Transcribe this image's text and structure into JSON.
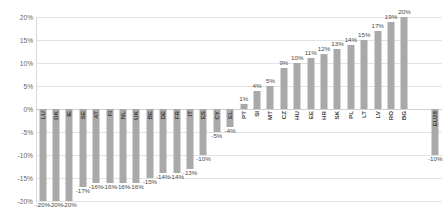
{
  "chart_data": {
    "type": "bar",
    "title": "",
    "subtitle": "",
    "xlabel": "",
    "ylabel": "",
    "ylim": [
      -20,
      20
    ],
    "ytick_values": [
      20,
      15,
      10,
      5,
      0,
      -5,
      -10,
      -15,
      -20
    ],
    "ytick_labels": [
      "20%",
      "15%",
      "10%",
      "5%",
      "0%",
      "-5%",
      "-10%",
      "-15%",
      "-20%"
    ],
    "grid": true,
    "legend": "none",
    "bar_color": "#a9a9a9",
    "categories": [
      "LU",
      "DK",
      "IE",
      "SE",
      "AT",
      "FI",
      "NL",
      "UK",
      "BE",
      "DE",
      "FR",
      "IT",
      "ES",
      "CY",
      "EL",
      "PT",
      "SI",
      "MT",
      "CZ",
      "HU",
      "EE",
      "HR",
      "SK",
      "PL",
      "LT",
      "LV",
      "RO",
      "BG",
      "EU28"
    ],
    "values": [
      -20,
      -20,
      -20,
      -17,
      -16,
      -16,
      -16,
      -16,
      -15,
      -14,
      -14,
      -13,
      -10,
      -5,
      -4,
      1,
      4,
      5,
      9,
      10,
      11,
      12,
      13,
      14,
      15,
      17,
      19,
      20,
      -10
    ],
    "data_labels": [
      "-20%",
      "-20%",
      "-20%",
      "-17%",
      "-16%",
      "-16%",
      "-16%",
      "-16%",
      "-15%",
      "-14%",
      "-14%",
      "-13%",
      "-10%",
      "-5%",
      "-4%",
      "1%",
      "4%",
      "5%",
      "9%",
      "10%",
      "11%",
      "12%",
      "13%",
      "14%",
      "15%",
      "17%",
      "19%",
      "20%",
      "-10%"
    ],
    "separated_last": true
  }
}
